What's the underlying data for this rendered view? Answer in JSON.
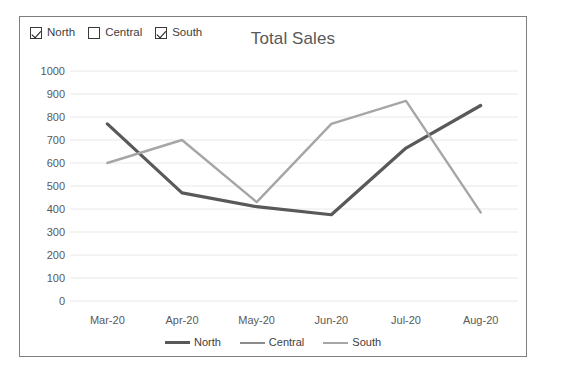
{
  "chart_title": "Total Sales",
  "checkbox_legend": [
    {
      "label": "North",
      "checked": true,
      "icon": "checkbox-checked-icon"
    },
    {
      "label": "Central",
      "checked": false,
      "icon": "checkbox-unchecked-icon"
    },
    {
      "label": "South",
      "checked": true,
      "icon": "checkbox-checked-icon"
    }
  ],
  "legend": [
    {
      "label": "North",
      "color": "#595959",
      "width": 3.2
    },
    {
      "label": "Central",
      "color": "#8c8c8c",
      "width": 2.4
    },
    {
      "label": "South",
      "color": "#a6a6a6",
      "width": 2.4
    }
  ],
  "chart_data": {
    "type": "line",
    "title": "Total Sales",
    "xlabel": "",
    "ylabel": "",
    "categories": [
      "Mar-20",
      "Apr-20",
      "May-20",
      "Jun-20",
      "Jul-20",
      "Aug-20"
    ],
    "series": [
      {
        "name": "North",
        "color": "#595959",
        "width": 3.2,
        "visible": true,
        "values": [
          770,
          470,
          410,
          375,
          665,
          850
        ]
      },
      {
        "name": "Central",
        "color": "#8c8c8c",
        "width": 2.4,
        "visible": false,
        "values": [
          null,
          null,
          null,
          null,
          null,
          null
        ]
      },
      {
        "name": "South",
        "color": "#a6a6a6",
        "width": 2.4,
        "visible": true,
        "values": [
          600,
          700,
          430,
          770,
          870,
          385
        ]
      }
    ],
    "ylim": [
      0,
      1000
    ],
    "yticks": [
      0,
      100,
      200,
      300,
      400,
      500,
      600,
      700,
      800,
      900,
      1000
    ],
    "ytick_labels": [
      "0",
      "100",
      "200",
      "300",
      "400",
      "500",
      "600",
      "700",
      "800",
      "900",
      "1000"
    ],
    "grid": true,
    "grid_axis": "y",
    "grid_color": "#e8e8e8",
    "legend_position": "bottom",
    "markers": false
  }
}
